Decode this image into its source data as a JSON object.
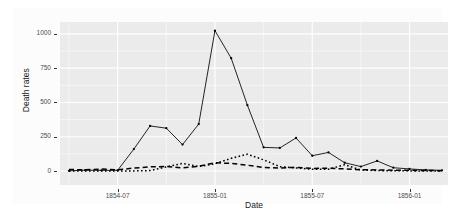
{
  "chart_data": {
    "type": "line",
    "title": "",
    "xlabel": "Date",
    "ylabel": "Death rates",
    "xlim": [
      "1854-04",
      "1856-03"
    ],
    "ylim": [
      0,
      1023
    ],
    "grid": true,
    "legend": "none",
    "panel_background": "#ebebeb",
    "gridline_color": "#ffffff",
    "line_color": "#000000",
    "y_ticks": [
      0,
      250,
      500,
      750,
      1000
    ],
    "y_tick_labels": [
      "0",
      "250",
      "500",
      "750",
      "1000"
    ],
    "x_ticks": [
      "1854-07",
      "1855-01",
      "1855-07",
      "1856-01"
    ],
    "x_tick_labels": [
      "1854-07",
      "1855-01",
      "1855-07",
      "1856-01"
    ],
    "x": [
      "1854-04",
      "1854-05",
      "1854-06",
      "1854-07",
      "1854-08",
      "1854-09",
      "1854-10",
      "1854-11",
      "1854-12",
      "1855-01",
      "1855-02",
      "1855-03",
      "1855-04",
      "1855-05",
      "1855-06",
      "1855-07",
      "1855-08",
      "1855-09",
      "1855-10",
      "1855-11",
      "1855-12",
      "1856-01",
      "1856-02",
      "1856-03"
    ],
    "series": [
      {
        "name": "Zymotic diseases",
        "style": "solid",
        "markers": true,
        "values": [
          1.4,
          6.2,
          4.7,
          5.2,
          160.0,
          328.5,
          312.2,
          192.4,
          342.5,
          1023.5,
          822.8,
          480.3,
          172.4,
          168.1,
          240.8,
          111.3,
          135.5,
          60.1,
          32.2,
          73.6,
          23.9,
          15.0,
          8.0,
          5.0
        ]
      },
      {
        "name": "Wounds and injuries",
        "style": "dotted",
        "markers": false,
        "values": [
          0.0,
          0.0,
          0.0,
          0.0,
          0.9,
          3.1,
          29.8,
          55.2,
          32.3,
          52.2,
          92.5,
          122.3,
          81.4,
          31.6,
          22.6,
          12.6,
          12.4,
          45.9,
          6.8,
          3.0,
          2.1,
          0.7,
          0.6,
          0.3
        ]
      },
      {
        "name": "All other causes",
        "style": "dashed",
        "markers": false,
        "values": [
          10.7,
          9.2,
          13.9,
          8.4,
          21.2,
          30.4,
          33.0,
          22.9,
          34.2,
          59.5,
          55.6,
          42.3,
          25.3,
          22.3,
          26.6,
          18.9,
          19.9,
          15.5,
          9.0,
          8.0,
          6.2,
          5.1,
          3.5,
          2.3
        ]
      }
    ]
  },
  "axes": {
    "y_title": "Death rates",
    "x_title": "Date"
  }
}
